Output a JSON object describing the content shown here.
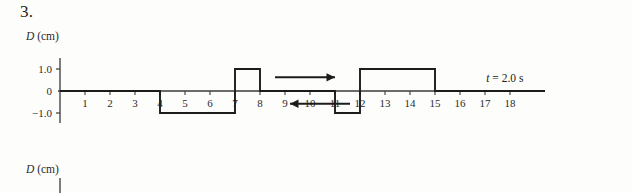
{
  "problem": {
    "number": "3."
  },
  "figure_top": {
    "y_axis_label": "D (cm)",
    "y_axis_label_symbol": "D",
    "y_axis_label_unit": "(cm)",
    "time_annotation": "t = 2.0 s",
    "time_annotation_symbol": "t",
    "time_annotation_value": "= 2.0 s",
    "y_ticks": [
      {
        "value": 1.0,
        "label": "1.0"
      },
      {
        "value": 0.0,
        "label": "0"
      },
      {
        "value": -1.0,
        "label": "−1.0"
      }
    ],
    "x_ticks": [
      {
        "value": 1,
        "label": "1"
      },
      {
        "value": 2,
        "label": "2"
      },
      {
        "value": 3,
        "label": "3"
      },
      {
        "value": 4,
        "label": "4"
      },
      {
        "value": 5,
        "label": "5"
      },
      {
        "value": 6,
        "label": "6"
      },
      {
        "value": 7,
        "label": "7"
      },
      {
        "value": 8,
        "label": "8"
      },
      {
        "value": 9,
        "label": "9"
      },
      {
        "value": 10,
        "label": "10"
      },
      {
        "value": 11,
        "label": "11"
      },
      {
        "value": 12,
        "label": "12"
      },
      {
        "value": 13,
        "label": "13"
      },
      {
        "value": 14,
        "label": "14"
      },
      {
        "value": 15,
        "label": "15"
      },
      {
        "value": 16,
        "label": "16"
      },
      {
        "value": 17,
        "label": "17"
      },
      {
        "value": 18,
        "label": "18"
      }
    ],
    "arrows": [
      {
        "name": "right-arrow",
        "direction": "right",
        "x_start": 8.6,
        "x_end": 11.0,
        "y_value": 0.62
      },
      {
        "name": "left-arrow",
        "direction": "left",
        "x_start": 11.6,
        "x_end": 9.2,
        "y_value": -0.58
      }
    ]
  },
  "figure_bottom": {
    "y_axis_label": "D (cm)",
    "y_axis_label_symbol": "D",
    "y_axis_label_unit": "(cm)"
  },
  "colors": {
    "ink": "#1c1c1c",
    "axis": "#3a3a3a",
    "background": "#fdfdfb"
  },
  "chart_data": {
    "type": "line",
    "title": "",
    "xlabel": "",
    "ylabel": "D (cm)",
    "xlim": [
      0,
      19.4
    ],
    "ylim": [
      -1.55,
      1.55
    ],
    "grid": false,
    "legend": null,
    "annotations": [
      {
        "text": "t = 2.0 s",
        "x": 17.2,
        "y": 0.55
      },
      {
        "text": "→",
        "x": 9.8,
        "y": 0.62
      },
      {
        "text": "←",
        "x": 10.4,
        "y": -0.58
      }
    ],
    "series": [
      {
        "name": "D(x)",
        "x": [
          0,
          4,
          4,
          7,
          7,
          8,
          8,
          11,
          11,
          12,
          12,
          15,
          15,
          19.4
        ],
        "values": [
          0,
          0,
          -1.0,
          -1.0,
          1.0,
          1.0,
          0,
          0,
          -1.0,
          -1.0,
          1.0,
          1.0,
          0,
          0
        ]
      }
    ],
    "segments": [
      {
        "from_x": 0,
        "to_x": 4,
        "level": 0.0
      },
      {
        "from_x": 4,
        "to_x": 7,
        "level": -1.0
      },
      {
        "from_x": 7,
        "to_x": 8,
        "level": 1.0
      },
      {
        "from_x": 8,
        "to_x": 11,
        "level": 0.0
      },
      {
        "from_x": 11,
        "to_x": 12,
        "level": -1.0
      },
      {
        "from_x": 12,
        "to_x": 15,
        "level": 1.0
      },
      {
        "from_x": 15,
        "to_x": 19.4,
        "level": 0.0
      }
    ]
  }
}
